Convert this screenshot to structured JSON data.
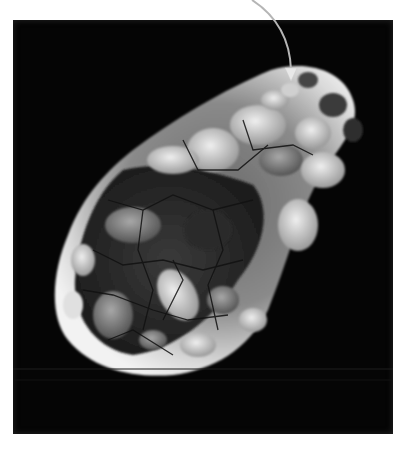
{
  "figure": {
    "background_color": "#050505",
    "page_color": "#ffffff",
    "annotation": {
      "type": "arrow",
      "color": "#b5b5b5",
      "start": [
        252,
        0
      ],
      "tip": [
        292,
        80
      ]
    }
  }
}
